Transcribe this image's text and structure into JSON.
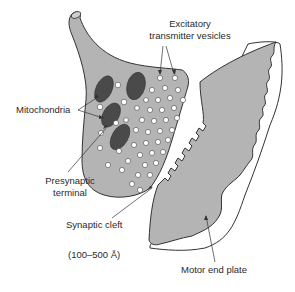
{
  "diagram": {
    "colors": {
      "tissue_fill": "#b4b4b4",
      "mitochondria_fill": "#4a4a4a",
      "vesicle_fill": "#ffffff",
      "outline": "#333333",
      "text": "#2a2a2a"
    },
    "labels": {
      "vesicles_line1": "Excitatory",
      "vesicles_line2": "transmitter vesicles",
      "mitochondria": "Mitochondria",
      "presynaptic_line1": "Presynaptic",
      "presynaptic_line2": "terminal",
      "synaptic_cleft": "Synaptic cleft",
      "cleft_width": "(100–500 Å)",
      "motor_end_plate": "Motor end plate"
    },
    "structures": [
      "presynaptic-terminal",
      "mitochondria",
      "transmitter-vesicles",
      "synaptic-cleft",
      "motor-end-plate"
    ]
  }
}
